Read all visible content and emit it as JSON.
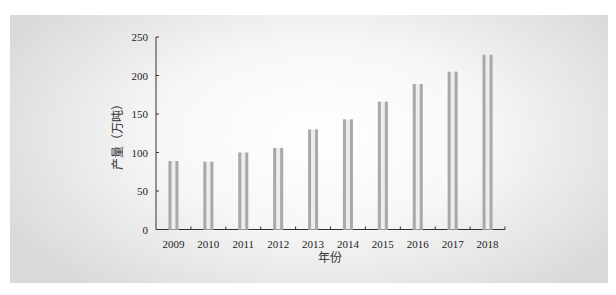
{
  "chart_data": {
    "type": "bar",
    "title": "",
    "xlabel": "年份",
    "ylabel": "产量（万吨）",
    "categories": [
      "2009",
      "2010",
      "2011",
      "2012",
      "2013",
      "2014",
      "2015",
      "2016",
      "2017",
      "2018"
    ],
    "values": [
      89,
      88,
      100,
      106,
      130,
      143,
      166,
      189,
      205,
      227
    ],
    "ylim": [
      0,
      250
    ],
    "yticks": [
      0,
      50,
      100,
      150,
      200,
      250
    ],
    "grid": false,
    "legend": "none",
    "bar_color": "#a9a9a9"
  }
}
